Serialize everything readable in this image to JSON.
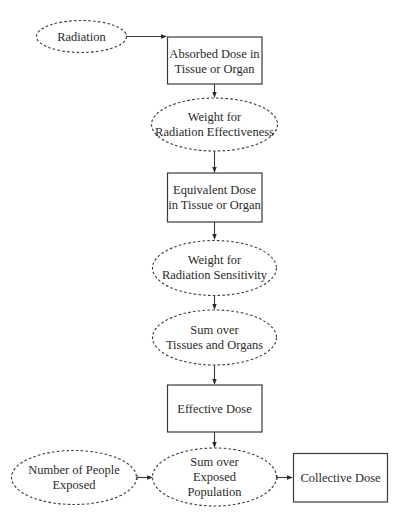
{
  "diagram": {
    "type": "flowchart",
    "colors": {
      "stroke": "#3a3a3a",
      "text": "#2a2a2a",
      "background": "#ffffff"
    },
    "nodes": {
      "radiation": {
        "shape": "dashed-ellipse",
        "lines": [
          "Radiation"
        ]
      },
      "absorbed_dose": {
        "shape": "box",
        "lines": [
          "Absorbed Dose in",
          "Tissue or Organ"
        ]
      },
      "weight_effectiveness": {
        "shape": "dashed-ellipse",
        "lines": [
          "Weight for",
          "Radiation Effectiveness"
        ]
      },
      "equivalent_dose": {
        "shape": "box",
        "lines": [
          "Equivalent Dose",
          "in Tissue or Organ"
        ]
      },
      "weight_sensitivity": {
        "shape": "dashed-ellipse",
        "lines": [
          "Weight for",
          "Radiation Sensitivity"
        ]
      },
      "sum_tissues": {
        "shape": "dashed-ellipse",
        "lines": [
          "Sum over",
          "Tissues and Organs"
        ]
      },
      "effective_dose": {
        "shape": "box",
        "lines": [
          "Effective Dose"
        ]
      },
      "number_people": {
        "shape": "dashed-ellipse",
        "lines": [
          "Number of People",
          "Exposed"
        ]
      },
      "sum_population": {
        "shape": "dashed-ellipse",
        "lines": [
          "Sum over",
          "Exposed",
          "Population"
        ]
      },
      "collective_dose": {
        "shape": "box",
        "lines": [
          "Collective Dose"
        ]
      }
    },
    "edges": [
      {
        "from": "radiation",
        "to": "absorbed_dose"
      },
      {
        "from": "absorbed_dose",
        "to": "weight_effectiveness"
      },
      {
        "from": "weight_effectiveness",
        "to": "equivalent_dose"
      },
      {
        "from": "equivalent_dose",
        "to": "weight_sensitivity"
      },
      {
        "from": "weight_sensitivity",
        "to": "sum_tissues"
      },
      {
        "from": "sum_tissues",
        "to": "effective_dose"
      },
      {
        "from": "effective_dose",
        "to": "sum_population"
      },
      {
        "from": "number_people",
        "to": "sum_population"
      },
      {
        "from": "sum_population",
        "to": "collective_dose"
      }
    ]
  }
}
